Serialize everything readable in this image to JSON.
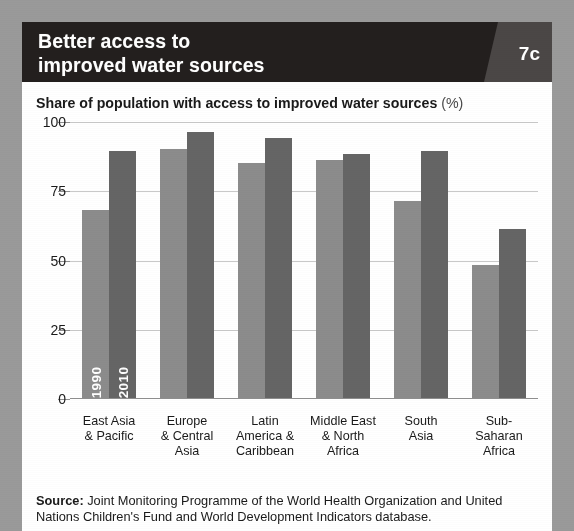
{
  "header": {
    "title": "Better access to\nimproved water sources",
    "badge": "7c"
  },
  "subtitle": {
    "main": "Share of population with access to improved water sources",
    "unit": "(%)"
  },
  "source": {
    "label": "Source:",
    "text": " Joint Monitoring Programme of the World Health Organization and United Nations Children's Fund and World Development Indicators database."
  },
  "colors": {
    "background": "#9a9a9a",
    "card": "#ffffff",
    "header": "#231f1e",
    "badge_panel": "#4b4746",
    "bar_1990": "#8c8c8c",
    "bar_2010": "#656565",
    "gridline": "#c9c9c9",
    "axis": "#8f8f8f"
  },
  "chart_data": {
    "type": "bar",
    "xlabel": "",
    "ylabel": "",
    "ylim": [
      0,
      100
    ],
    "yticks": [
      0,
      25,
      50,
      75,
      100
    ],
    "ytick_labels": [
      "0",
      "25",
      "50",
      "75",
      "100"
    ],
    "grid": true,
    "legend_position": "in-bar",
    "categories": [
      "East Asia\n& Pacific",
      "Europe\n& Central\nAsia",
      "Latin\nAmerica &\nCaribbean",
      "Middle East\n& North\nAfrica",
      "South\nAsia",
      "Sub-Saharan\nAfrica"
    ],
    "series": [
      {
        "name": "1990",
        "color": "#8c8c8c",
        "values": [
          68,
          90,
          85,
          86,
          71,
          48
        ]
      },
      {
        "name": "2010",
        "color": "#656565",
        "values": [
          89,
          96,
          94,
          88,
          89,
          61
        ]
      }
    ],
    "inbar_labels": [
      "1990",
      "2010"
    ],
    "inbar_labels_group_index": 0
  }
}
